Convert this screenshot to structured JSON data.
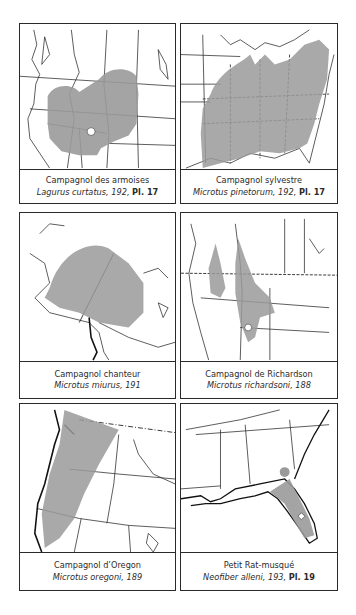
{
  "figure": "range maps",
  "colors": {
    "range_fill": "#9a9a9a",
    "border": "#2a2a2a",
    "background": "#ffffff"
  },
  "panels": [
    {
      "common_name": "Campagnol des armoises",
      "scientific_name": "Lagurus curtatus",
      "ref": ", 192, ",
      "plate": "Pl. 17",
      "region": "western-us-northwest"
    },
    {
      "common_name": "Campagnol sylvestre",
      "scientific_name": "Microtus pinetorum",
      "ref": ", 192, ",
      "plate": "Pl. 17",
      "region": "eastern-us"
    },
    {
      "common_name": "Campagnol chanteur",
      "scientific_name": "Microtus miurus",
      "ref": ", 191",
      "plate": "",
      "region": "alaska-yukon"
    },
    {
      "common_name": "Campagnol de Richardson",
      "scientific_name": "Microtus richardsoni",
      "ref": ", 188",
      "plate": "",
      "region": "northwest-us-canada"
    },
    {
      "common_name": "Campagnol d’Oregon",
      "scientific_name": "Microtus oregoni",
      "ref": ", 189",
      "plate": "",
      "region": "pacific-northwest"
    },
    {
      "common_name": "Petit Rat-musqué",
      "scientific_name": "Neofiber alleni",
      "ref": ", 193, ",
      "plate": "Pl. 19",
      "region": "southeast-us-florida"
    }
  ]
}
